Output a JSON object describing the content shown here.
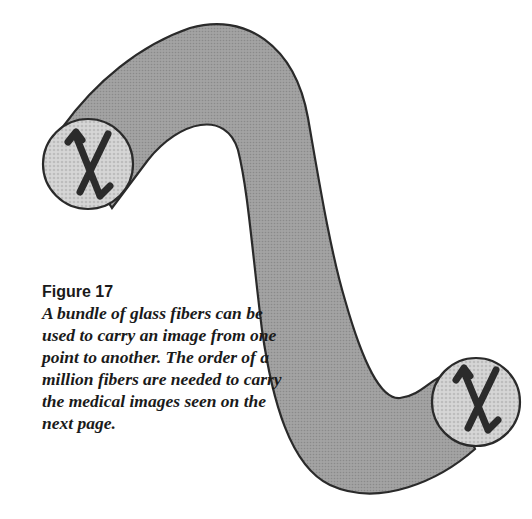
{
  "figure": {
    "label": "Figure 17",
    "caption": "A bundle of glass fibers can be used to carry an image from one point to another. The order of a million fibers are needed to carry the medical images seen on the next page."
  },
  "illustration": {
    "subject": "fiber-optic-bundle",
    "end_symbol": "χ",
    "colors": {
      "bundle_fill": "#9a9a9a",
      "end_face_fill": "#cfcfcf",
      "outline": "#2a2a2a",
      "symbol": "#2b2b2b"
    }
  }
}
